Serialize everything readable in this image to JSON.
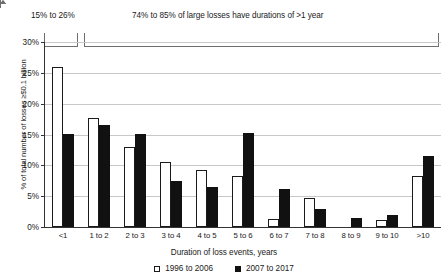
{
  "chart_data": {
    "type": "bar",
    "title": "",
    "xlabel": "Duration of loss events, years",
    "ylabel": "% of total number of losses ≥$0.1 billion",
    "ylim": [
      0,
      30
    ],
    "ytick_labels": [
      "30%",
      "25%",
      "20%",
      "15%",
      "10%",
      "5%",
      "0%"
    ],
    "ytick_values": [
      30,
      25,
      20,
      15,
      10,
      5,
      0
    ],
    "grid": true,
    "legend_position": "bottom-center",
    "categories": [
      "<1",
      "1 to 2",
      "2 to 3",
      "3 to 4",
      "4 to 5",
      "5 to 6",
      "6 to 7",
      "7 to 8",
      "8 to 9",
      "9 to 10",
      ">10"
    ],
    "series": [
      {
        "name": "1996 to 2006",
        "style": "hollow",
        "values": [
          26.0,
          17.7,
          13.0,
          10.5,
          9.3,
          8.2,
          1.3,
          4.7,
          0.0,
          1.2,
          8.2
        ]
      },
      {
        "name": "2007 to 2017",
        "style": "filled",
        "values": [
          15.1,
          16.5,
          15.1,
          7.5,
          6.5,
          15.3,
          6.2,
          3.0,
          1.5,
          2.0,
          11.5
        ]
      }
    ],
    "annotations": [
      {
        "id": "annot-1",
        "text": "15% to 26%",
        "covers_categories": [
          "<1"
        ]
      },
      {
        "id": "annot-2",
        "text": "74% to 85% of large losses have durations of >1 year",
        "covers_categories": [
          "1 to 2",
          "2 to 3",
          "3 to 4",
          "4 to 5",
          "5 to 6",
          "6 to 7",
          "7 to 8",
          "8 to 9",
          "9 to 10",
          ">10"
        ]
      }
    ]
  },
  "legend": {
    "items": [
      {
        "label": "1996 to 2006"
      },
      {
        "label": "2007 to 2017"
      }
    ]
  }
}
